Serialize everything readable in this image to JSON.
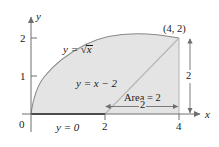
{
  "figure": {
    "axes": {
      "x_label": "x",
      "y_label": "y",
      "x_ticks": [
        {
          "value": 2,
          "label": "2"
        },
        {
          "value": 4,
          "label": "4"
        }
      ],
      "y_ticks": [
        {
          "value": 1,
          "label": "1"
        },
        {
          "value": 2,
          "label": "2"
        }
      ],
      "origin_label": "0",
      "x_range": [
        0,
        4.85
      ],
      "y_range": [
        0,
        2.55
      ]
    },
    "curves": [
      {
        "name": "sqrt-curve",
        "equation_label_lead": "y = ",
        "equation_label_radicand": "x",
        "function": "y = sqrt(x)",
        "domain": [
          0,
          4
        ]
      },
      {
        "name": "diagonal-line",
        "equation_label": "y = x − 2",
        "function": "y = x - 2",
        "domain": [
          2,
          4
        ]
      },
      {
        "name": "baseline",
        "equation_label": "y = 0",
        "function": "y = 0",
        "domain": [
          0,
          2
        ]
      }
    ],
    "vertex_label": "(4, 2)",
    "vertex_point": [
      4,
      2
    ],
    "area_label": "Area = 2",
    "dimensions": [
      {
        "name": "horizontal-span",
        "label": "2",
        "from": [
          2,
          0
        ],
        "to": [
          4,
          0
        ]
      },
      {
        "name": "vertical-span",
        "label": "2",
        "from": [
          4,
          0
        ],
        "to": [
          4,
          2
        ]
      }
    ],
    "colors": {
      "shade_fill": "#e4e4e4",
      "curve_stroke": "#8a8a8a",
      "axis_stroke": "#6e6e6e",
      "baseline_stroke": "#2b2b2b",
      "text": "#1a1a1a"
    }
  }
}
